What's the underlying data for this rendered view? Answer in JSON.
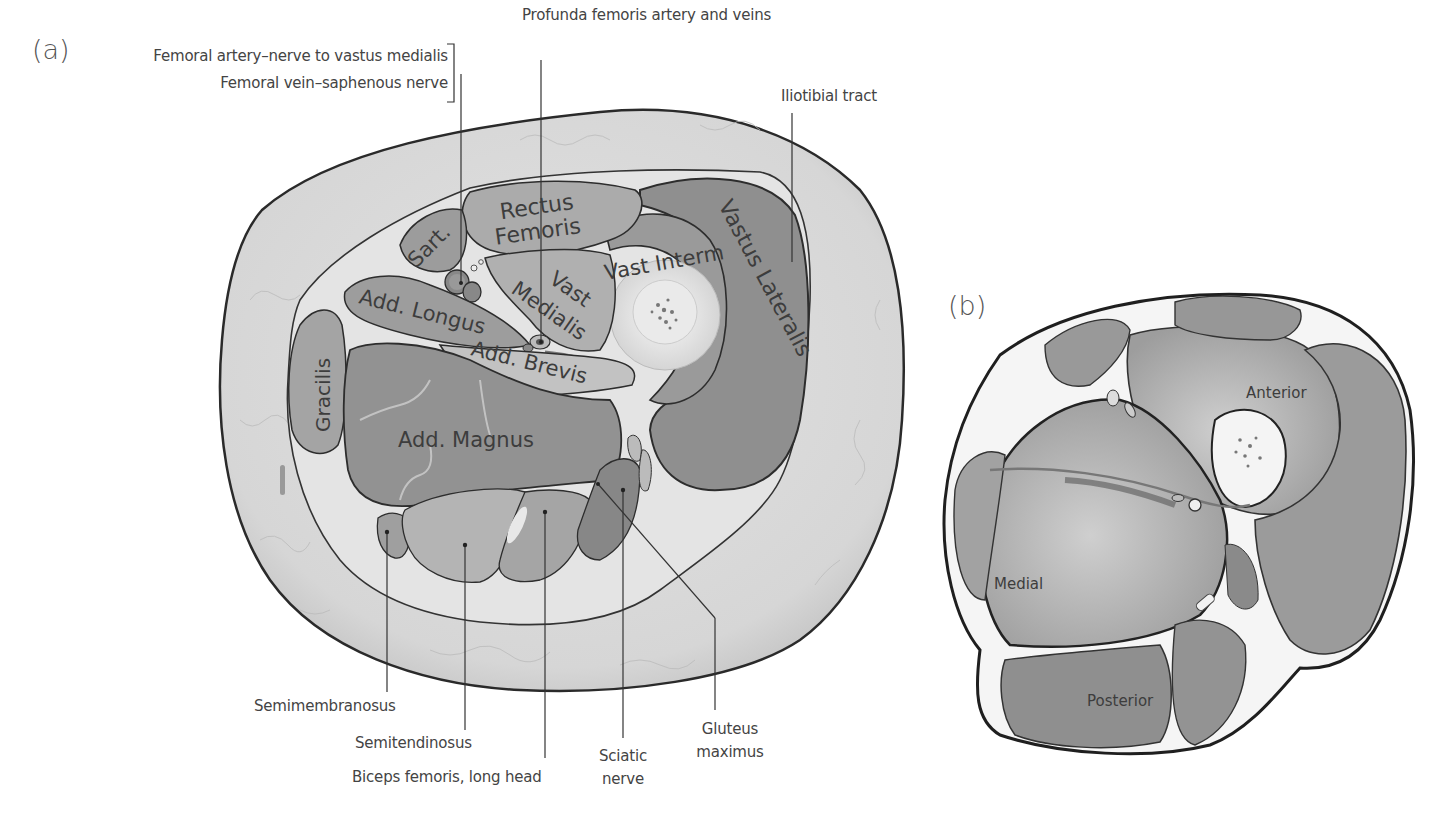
{
  "panels": {
    "a": {
      "label": "(a)"
    },
    "b": {
      "label": "(b)"
    }
  },
  "panel_a": {
    "callouts": {
      "femoral_artery": "Femoral artery–nerve to vastus medialis",
      "femoral_vein": "Femoral vein–saphenous nerve",
      "profunda": "Profunda femoris artery and veins",
      "iliotibial": "Iliotibial tract",
      "semimembranosus": "Semimembranosus",
      "semitendinosus": "Semitendinosus",
      "biceps": "Biceps femoris, long head",
      "sciatic_1": "Sciatic",
      "sciatic_2": "nerve",
      "gluteus_1": "Gluteus",
      "gluteus_2": "maximus"
    },
    "muscles": {
      "sartorius": "Sart.",
      "rectus_1": "Rectus",
      "rectus_2": "Femoris",
      "vast_interm": "Vast Interm",
      "vastus_lateralis": "Vastus Lateralis",
      "vast_medialis_1": "Vast",
      "vast_medialis_2": "Medialis",
      "add_longus": "Add. Longus",
      "add_brevis": "Add. Brevis",
      "gracilis": "Gracilis",
      "add_magnus": "Add. Magnus"
    }
  },
  "panel_b": {
    "compartments": {
      "anterior": "Anterior",
      "medial": "Medial",
      "posterior": "Posterior"
    }
  },
  "colors": {
    "skin_fat": "#dcdcdc",
    "muscle_dark": "#8e8e8e",
    "muscle_mid": "#a8a8a8",
    "muscle_light": "#bdbdbd",
    "fascia": "#f2f2f2",
    "outline": "#2a2a2a",
    "bone": "#e6e6e6"
  }
}
